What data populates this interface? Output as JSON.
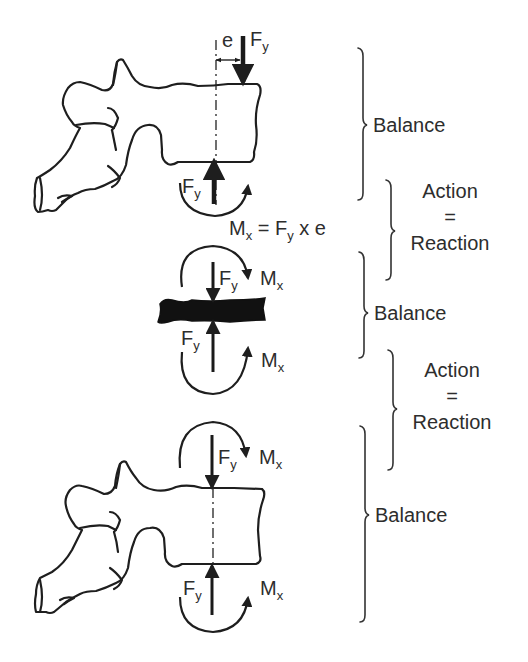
{
  "diagram": {
    "type": "biomechanics-free-body",
    "components": [
      "upper vertebra",
      "intervertebral disc",
      "lower vertebra"
    ],
    "symbols": {
      "force": "F",
      "force_sub": "y",
      "moment": "M",
      "moment_sub": "x",
      "eccentricity": "e"
    },
    "equation": {
      "lhs": "M",
      "lhs_sub": "x",
      "eq": " = F",
      "rhs_sub": "y",
      "rest": " x e"
    },
    "brackets": [
      {
        "label": "Balance"
      },
      {
        "label_top": "Action",
        "label_mid": "=",
        "label_bottom": "Reaction"
      },
      {
        "label": "Balance"
      },
      {
        "label_top": "Action",
        "label_mid": "=",
        "label_bottom": "Reaction"
      },
      {
        "label": "Balance"
      }
    ],
    "colors": {
      "ink": "#222222",
      "background": "#ffffff"
    }
  }
}
